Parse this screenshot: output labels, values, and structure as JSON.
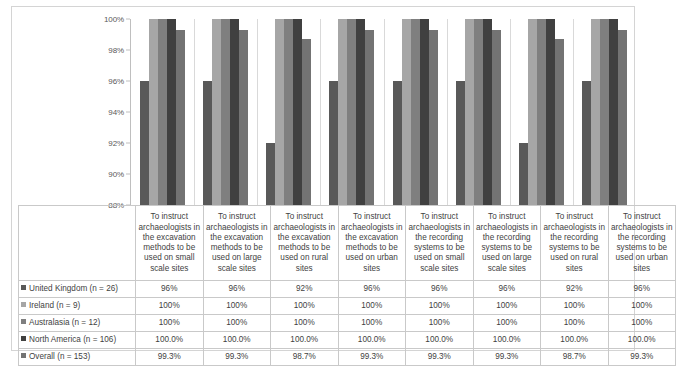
{
  "chart_data": {
    "type": "bar",
    "title": "",
    "subtitle": "",
    "xlabel": "",
    "ylabel": "",
    "ylim": [
      88,
      100
    ],
    "ytick_labels": [
      "100%",
      "98%",
      "96%",
      "94%",
      "92%",
      "90%",
      "88%"
    ],
    "ytick_values": [
      100,
      98,
      96,
      94,
      92,
      90,
      88
    ],
    "grid": false,
    "legend_position": "bottom-table",
    "categories": [
      "To instruct archaeologists in the excavation methods to be used on small scale sites",
      "To instruct archaeologists in the excavation methods to be used on large scale sites",
      "To instruct archaeologists in the excavation methods to be used on rural sites",
      "To instruct archaeologists in the excavation methods to be used on urban sites",
      "To instruct archaeologists in the recording systems to be used on small scale sites",
      "To instruct archaeologists in the recording systems to be used on large scale sites",
      "To instruct archaeologists in the recording systems to be used on rural sites",
      "To instruct archaeologists in the recording systems to be used on urban sites"
    ],
    "series": [
      {
        "name": "United Kingdom (n = 26)",
        "color": "#595959",
        "values": [
          96,
          96,
          92,
          96,
          96,
          96,
          92,
          96
        ],
        "labels": [
          "96%",
          "96%",
          "92%",
          "96%",
          "96%",
          "96%",
          "92%",
          "96%"
        ]
      },
      {
        "name": "Ireland (n = 9)",
        "color": "#a6a6a6",
        "values": [
          100,
          100,
          100,
          100,
          100,
          100,
          100,
          100
        ],
        "labels": [
          "100%",
          "100%",
          "100%",
          "100%",
          "100%",
          "100%",
          "100%",
          "100%"
        ]
      },
      {
        "name": "Australasia (n = 12)",
        "color": "#7f7f7f",
        "values": [
          100,
          100,
          100,
          100,
          100,
          100,
          100,
          100
        ],
        "labels": [
          "100%",
          "100%",
          "100%",
          "100%",
          "100%",
          "100%",
          "100%",
          "100%"
        ]
      },
      {
        "name": "North America (n = 106)",
        "color": "#404040",
        "values": [
          100.0,
          100.0,
          100.0,
          100.0,
          100.0,
          100.0,
          100.0,
          100.0
        ],
        "labels": [
          "100.0%",
          "100.0%",
          "100.0%",
          "100.0%",
          "100.0%",
          "100.0%",
          "100.0%",
          "100.0%"
        ]
      },
      {
        "name": "Overall (n = 153)",
        "color": "#737373",
        "values": [
          99.3,
          99.3,
          98.7,
          99.3,
          99.3,
          99.3,
          98.7,
          99.3
        ],
        "labels": [
          "99.3%",
          "99.3%",
          "98.7%",
          "99.3%",
          "99.3%",
          "99.3%",
          "98.7%",
          "99.3%"
        ]
      }
    ]
  }
}
